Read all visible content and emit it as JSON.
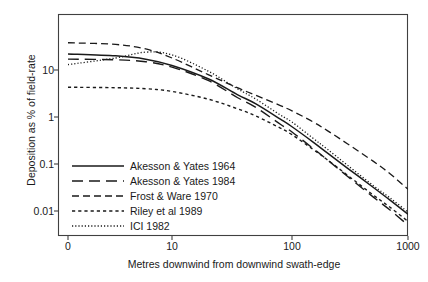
{
  "chart_data": {
    "type": "line",
    "title": "",
    "xlabel": "Metres downwind from downwind swath-edge",
    "ylabel": "Deposition as % of field-rate",
    "xscale": "log-offset",
    "yscale": "log",
    "xticks": [
      "0",
      "10",
      "100",
      "1000"
    ],
    "xtick_values": [
      0,
      10,
      100,
      1000
    ],
    "yticks": [
      "10",
      "1",
      "0.1",
      "0.01"
    ],
    "ytick_values": [
      10,
      1,
      0.1,
      0.01
    ],
    "ylim": [
      0.002,
      70
    ],
    "xlim": [
      0,
      1000
    ],
    "grid": false,
    "legend_position": "lower-left-inside",
    "series": [
      {
        "name": "Akesson & Yates 1964",
        "style": "solid",
        "x": [
          0,
          2,
          5,
          10,
          20,
          35,
          50,
          80,
          100,
          150,
          200,
          300,
          500,
          700,
          1000
        ],
        "values": [
          22,
          20,
          17,
          12.5,
          6.5,
          3.0,
          1.9,
          0.9,
          0.62,
          0.3,
          0.175,
          0.082,
          0.032,
          0.017,
          0.0085
        ]
      },
      {
        "name": "Akesson & Yates 1984",
        "style": "long-dash",
        "x": [
          0,
          2,
          5,
          10,
          20,
          35,
          50,
          80,
          100,
          150,
          200,
          300,
          500,
          700,
          1000
        ],
        "values": [
          17,
          16.5,
          15,
          11.5,
          6.0,
          2.6,
          1.6,
          0.7,
          0.48,
          0.22,
          0.125,
          0.055,
          0.02,
          0.0105,
          0.005
        ]
      },
      {
        "name": "Frost & Ware 1970",
        "style": "dash-dot",
        "x": [
          0,
          2,
          5,
          10,
          20,
          35,
          50,
          80,
          100,
          150,
          200,
          300,
          500,
          700,
          1000
        ],
        "values": [
          38,
          35,
          28,
          18,
          8.0,
          4.2,
          2.9,
          1.75,
          1.35,
          0.8,
          0.52,
          0.27,
          0.115,
          0.062,
          0.029
        ]
      },
      {
        "name": "Riley et al 1989",
        "style": "dotted-coarse",
        "x": [
          0,
          2,
          5,
          10,
          20,
          35,
          50,
          80,
          100,
          150,
          200,
          300,
          500,
          700,
          1000
        ],
        "values": [
          4.3,
          4.2,
          4.0,
          3.5,
          2.4,
          1.5,
          1.05,
          0.58,
          0.42,
          0.21,
          0.125,
          0.058,
          0.022,
          0.012,
          0.006
        ]
      },
      {
        "name": "ICI 1982",
        "style": "dotted-fine",
        "x": [
          0,
          2,
          5,
          10,
          20,
          35,
          50,
          80,
          100,
          150,
          200,
          300,
          500,
          700,
          1000
        ],
        "values": [
          13,
          18,
          24,
          21,
          9.5,
          4.0,
          2.4,
          1.1,
          0.78,
          0.36,
          0.21,
          0.095,
          0.035,
          0.019,
          0.0095
        ]
      }
    ]
  },
  "legend": {
    "items": [
      {
        "label": "Akesson & Yates 1964"
      },
      {
        "label": "Akesson & Yates 1984"
      },
      {
        "label": "Frost & Ware 1970"
      },
      {
        "label": "Riley et al 1989"
      },
      {
        "label": "ICI 1982"
      }
    ]
  },
  "colors": {
    "ink": "#1a1a1a",
    "axis": "#404040",
    "background": "#ffffff"
  }
}
